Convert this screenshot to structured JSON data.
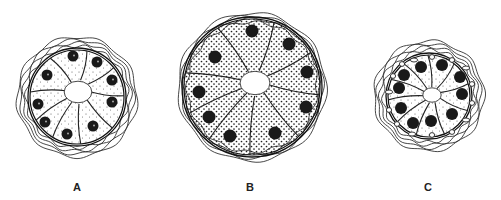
{
  "figure": {
    "panels": [
      {
        "label": "A",
        "center": [
          77,
          97
        ],
        "outer_radius": 60,
        "cell_radius": 47,
        "lumen_center": [
          78,
          92
        ],
        "lumen_radius": 12,
        "stipple": "sparse",
        "nuclei": [
          [
            73,
            56
          ],
          [
            97,
            62
          ],
          [
            112,
            80
          ],
          [
            112,
            102
          ],
          [
            93,
            126
          ],
          [
            67,
            134
          ],
          [
            45,
            122
          ],
          [
            38,
            104
          ],
          [
            47,
            75
          ]
        ],
        "nucleus_radius": 5.5,
        "vacuoles": []
      },
      {
        "label": "B",
        "center": [
          252,
          87
        ],
        "outer_radius": 74,
        "cell_radius": 68,
        "lumen_center": [
          255,
          83
        ],
        "lumen_radius": 13,
        "stipple": "dense",
        "nuclei": [
          [
            252,
            31
          ],
          [
            289,
            44
          ],
          [
            307,
            72
          ],
          [
            306,
            107
          ],
          [
            275,
            133
          ],
          [
            230,
            136
          ],
          [
            209,
            117
          ],
          [
            199,
            92
          ],
          [
            215,
            57
          ]
        ],
        "nucleus_radius": 6.5,
        "vacuoles": []
      },
      {
        "label": "C",
        "center": [
          429,
          96
        ],
        "outer_radius": 55,
        "cell_radius": 41,
        "lumen_center": [
          432,
          95
        ],
        "lumen_radius": 8,
        "stipple": "sparse",
        "nuclei": [
          [
            421,
            67
          ],
          [
            442,
            65
          ],
          [
            460,
            77
          ],
          [
            462,
            94
          ],
          [
            452,
            114
          ],
          [
            431,
            121
          ],
          [
            413,
            123
          ],
          [
            401,
            108
          ],
          [
            399,
            88
          ],
          [
            404,
            75
          ]
        ],
        "nucleus_radius": 6,
        "vacuoles": [
          [
            414,
            60
          ],
          [
            432,
            57
          ],
          [
            452,
            60
          ],
          [
            466,
            68
          ],
          [
            472,
            84
          ],
          [
            472,
            103
          ],
          [
            466,
            120
          ],
          [
            452,
            132
          ],
          [
            432,
            135
          ],
          [
            412,
            134
          ],
          [
            397,
            124
          ],
          [
            389,
            110
          ],
          [
            389,
            92
          ],
          [
            393,
            76
          ],
          [
            402,
            64
          ]
        ]
      }
    ],
    "labels": [
      {
        "text": "A",
        "x": 77,
        "y": 191
      },
      {
        "text": "B",
        "x": 250,
        "y": 191
      },
      {
        "text": "C",
        "x": 428,
        "y": 191
      }
    ]
  }
}
